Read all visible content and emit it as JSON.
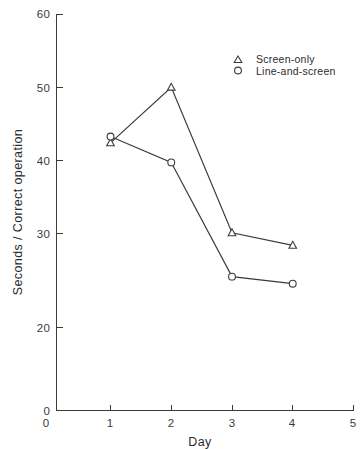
{
  "chart_data": {
    "type": "line",
    "title": "",
    "xlabel": "Day",
    "ylabel": "Seconds / Correct operation",
    "x": [
      1,
      2,
      3,
      4
    ],
    "xlim": [
      0,
      5
    ],
    "ylim": [
      0,
      60
    ],
    "grid": false,
    "legend_position": "top-right",
    "x_ticks": [
      "0",
      "1",
      "2",
      "3",
      "4",
      "5"
    ],
    "x_tick_values": [
      0,
      1,
      2,
      3,
      4,
      5
    ],
    "y_ticks": [
      "0",
      "20",
      "30",
      "40",
      "50",
      "60"
    ],
    "y_tick_values": [
      0,
      20,
      30,
      40,
      50,
      60
    ],
    "series": [
      {
        "name": "Screen-only",
        "marker": "triangle",
        "values": [
          43.6,
          50.7,
          32.1,
          30.5
        ]
      },
      {
        "name": "Line-and-screen",
        "marker": "circle",
        "values": [
          44.4,
          41.1,
          26.5,
          25.6
        ]
      }
    ]
  },
  "legend": {
    "entries": [
      {
        "marker_name": "triangle-marker-icon",
        "label": "Screen-only"
      },
      {
        "marker_name": "circle-marker-icon",
        "label": "Line-and-screen"
      }
    ]
  },
  "axes": {
    "y_title": "Seconds / Correct operation",
    "x_title": "Day",
    "y_labels": [
      "60",
      "50",
      "40",
      "30",
      "20",
      "0"
    ],
    "x_labels": [
      "0",
      "1",
      "2",
      "3",
      "4",
      "5"
    ]
  },
  "colors": {
    "ink": "#3a3a3a",
    "background": "#ffffff",
    "marker_fill": "#ffffff"
  }
}
